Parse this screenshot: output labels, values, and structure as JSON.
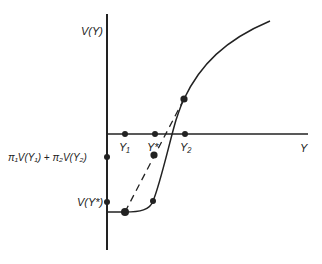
{
  "diagram": {
    "type": "utility-function",
    "colors": {
      "ink": "#222222",
      "background": "#ffffff"
    },
    "axes": {
      "y_label": "V(Y)",
      "x_label": "Y"
    },
    "x_ticks": {
      "y1": "Y₁",
      "ystar": "Y*",
      "y2": "Y₂"
    },
    "y_ticks": {
      "expected_utility": "π₁V(Y₁) + π₂V(Y₂)",
      "v_ystar": "V(Y*)"
    },
    "curves": [
      {
        "name": "utility-curve",
        "style": "solid",
        "shape": "flat-then-steep-then-concave"
      },
      {
        "name": "chord",
        "style": "dashed",
        "from": "V(Y₁)",
        "to": "V(Y₂)"
      }
    ],
    "points": [
      {
        "name": "v-y1",
        "label": "V(Y₁)"
      },
      {
        "name": "v-y2",
        "label": "V(Y₂)"
      },
      {
        "name": "expected-utility-point",
        "label": "π₁V(Y₁) + π₂V(Y₂)"
      },
      {
        "name": "v-ystar",
        "label": "V(Y*)"
      }
    ]
  }
}
